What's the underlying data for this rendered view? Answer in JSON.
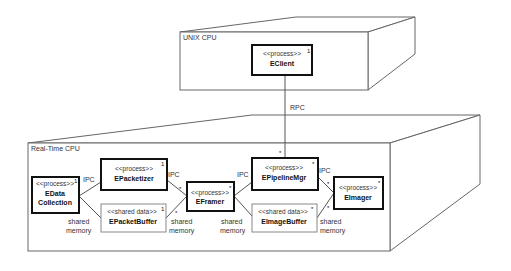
{
  "nodes": {
    "unix": {
      "label": "UNIX CPU"
    },
    "realtime": {
      "label": "Real-Time CPU"
    }
  },
  "components": {
    "eclient": {
      "stereotype": "<<process>>",
      "name": "EClient",
      "multiplicity": "1"
    },
    "edata": {
      "stereotype": "<<process>>",
      "name_line1": "EData",
      "name_line2": "Collection",
      "multiplicity": "1"
    },
    "epacketizer": {
      "stereotype": "<<process>>",
      "name": "EPacketizer",
      "multiplicity": "1"
    },
    "epacketbuffer": {
      "stereotype": "<<shared data>>",
      "name": "EPacketBuffer",
      "multiplicity": "1"
    },
    "eframer": {
      "stereotype": "<<process>>",
      "name": "EFramer",
      "multiplicity": "*"
    },
    "epipelinemgr": {
      "stereotype": "<<process>>",
      "name": "EPipelineMgr",
      "multiplicity": "*"
    },
    "eimagebuffer": {
      "stereotype": "<<shared data>>",
      "name": "EImageBuffer",
      "multiplicity": "*"
    },
    "eimager": {
      "stereotype": "<<process>>",
      "name": "EImager",
      "multiplicity": "*"
    }
  },
  "connections": {
    "rpc": {
      "label": "RPC",
      "end_multiplicity": "*"
    },
    "ipc1": {
      "label": "IPC"
    },
    "shared1": {
      "label_line1": "shared",
      "label_line2": "memory"
    },
    "ipc2": {
      "label": "IPC",
      "end_multiplicity": "*"
    },
    "shared2": {
      "label_line1": "shared",
      "label_line2": "memory",
      "end_multiplicity": "*"
    },
    "ipc3": {
      "label": "IPC"
    },
    "shared3": {
      "label_line1": "shared",
      "label_line2": "memory"
    },
    "ipc4": {
      "label": "IPC",
      "end_multiplicity": "*"
    },
    "shared4": {
      "label_line1": "shared",
      "label_line2": "memory",
      "end_multiplicity": "*"
    }
  }
}
